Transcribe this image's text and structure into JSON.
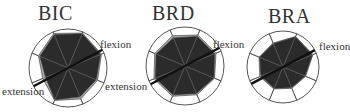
{
  "chart_data": [
    {
      "type": "radar",
      "title": "BIC",
      "axis_labels": [
        "flexion",
        "extension"
      ],
      "num_sectors": 8,
      "rlim": [
        0,
        1
      ],
      "series": [
        {
          "name": "inner",
          "color": "#2b2b2b",
          "values": [
            0.92,
            0.95,
            0.9,
            0.78,
            0.8,
            0.88,
            0.62,
            0.78
          ]
        },
        {
          "name": "outer",
          "color": "#a8a8a8",
          "values": [
            0.96,
            0.97,
            0.93,
            0.82,
            0.86,
            0.9,
            0.7,
            0.82
          ]
        }
      ],
      "line_angle_deg": 28,
      "grid": true
    },
    {
      "type": "radar",
      "title": "BRD",
      "axis_labels": [
        "flexion",
        "extension"
      ],
      "num_sectors": 8,
      "rlim": [
        0,
        1
      ],
      "series": [
        {
          "name": "inner",
          "color": "#2b2b2b",
          "values": [
            0.78,
            0.82,
            0.82,
            0.8,
            0.76,
            0.8,
            0.82,
            0.8
          ]
        },
        {
          "name": "outer",
          "color": "#a8a8a8",
          "values": [
            0.84,
            0.86,
            0.86,
            0.82,
            0.8,
            0.84,
            0.86,
            0.84
          ]
        }
      ],
      "line_angle_deg": 28,
      "grid": true
    },
    {
      "type": "radar",
      "title": "BRA",
      "axis_labels": [
        "flexion",
        "extension"
      ],
      "num_sectors": 8,
      "rlim": [
        0,
        1
      ],
      "series": [
        {
          "name": "inner",
          "color": "#2b2b2b",
          "values": [
            0.7,
            0.9,
            0.88,
            0.66,
            0.62,
            0.64,
            0.66,
            0.7
          ]
        },
        {
          "name": "outer",
          "color": "#a8a8a8",
          "values": [
            0.72,
            0.92,
            0.9,
            0.68,
            0.64,
            0.66,
            0.7,
            0.72
          ]
        }
      ],
      "line_angle_deg": 28,
      "grid": true
    }
  ],
  "panels": [
    {
      "title": "BIC",
      "flexion_label": "flexion",
      "extension_label": "extension"
    },
    {
      "title": "BRD",
      "flexion_label": "flexion",
      "extension_label": "extension"
    },
    {
      "title": "BRA",
      "flexion_label": "flexion",
      "extension_label": "extension"
    }
  ]
}
